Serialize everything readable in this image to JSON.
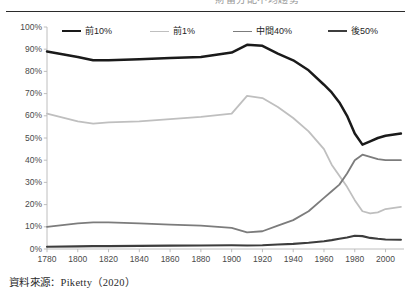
{
  "header": {
    "partial_title": "財富分配不均趨勢",
    "rule_color": "#2b2b2b"
  },
  "footer": {
    "source_note": "資料來源：Piketty（2020）"
  },
  "axes": {
    "y_ticks": [
      "0%",
      "10%",
      "20%",
      "30%",
      "40%",
      "50%",
      "60%",
      "70%",
      "80%",
      "90%",
      "100%"
    ],
    "x_ticks": [
      "1780",
      "1800",
      "1820",
      "1840",
      "1860",
      "1880",
      "1900",
      "1920",
      "1940",
      "1960",
      "1980",
      "2000"
    ],
    "axis_line_color": "#b7b7b7"
  },
  "legend": {
    "items": [
      {
        "label": "前10%",
        "color": "#1a1a1a"
      },
      {
        "label": "前1%",
        "color": "#bfbfbf"
      },
      {
        "label": "中間40%",
        "color": "#7c7c7c"
      },
      {
        "label": "後50%",
        "color": "#3d3d3d"
      }
    ]
  },
  "chart_data": {
    "type": "line",
    "title": "財富分配不均趨勢",
    "xlabel": "",
    "ylabel": "",
    "xlim": [
      1780,
      2012
    ],
    "ylim": [
      0,
      100
    ],
    "y_unit": "%",
    "grid": false,
    "legend_position": "top",
    "x": [
      1780,
      1800,
      1810,
      1820,
      1840,
      1860,
      1880,
      1900,
      1910,
      1920,
      1930,
      1940,
      1950,
      1960,
      1965,
      1970,
      1975,
      1980,
      1985,
      1990,
      1995,
      2000,
      2010
    ],
    "series": [
      {
        "name": "前10%",
        "color": "#1a1a1a",
        "values": [
          89,
          86.5,
          85,
          85,
          85.5,
          86,
          86.5,
          88.5,
          92,
          91.5,
          88,
          85,
          80.5,
          74,
          70.5,
          66,
          60,
          52,
          47,
          48.5,
          50,
          51,
          52
        ]
      },
      {
        "name": "前1%",
        "color": "#bfbfbf",
        "values": [
          61,
          57.5,
          56.5,
          57,
          57.5,
          58.5,
          59.5,
          61,
          69,
          68,
          64,
          59,
          53,
          45,
          38,
          33,
          28,
          22,
          17,
          16,
          16.5,
          18,
          19
        ]
      },
      {
        "name": "中間40%",
        "color": "#7c7c7c",
        "values": [
          10,
          11.5,
          12,
          12,
          11.5,
          11,
          10.5,
          9.5,
          7.5,
          8,
          10.5,
          13,
          17,
          23,
          26,
          29,
          34,
          40,
          42.5,
          41.5,
          40.5,
          40,
          40
        ]
      },
      {
        "name": "後50%",
        "color": "#3d3d3d",
        "values": [
          1,
          1.2,
          1.3,
          1.3,
          1.4,
          1.5,
          1.6,
          1.7,
          1.6,
          1.7,
          2,
          2.3,
          2.8,
          3.5,
          4,
          4.6,
          5.2,
          6,
          5.8,
          5,
          4.6,
          4.3,
          4.2
        ]
      }
    ]
  }
}
